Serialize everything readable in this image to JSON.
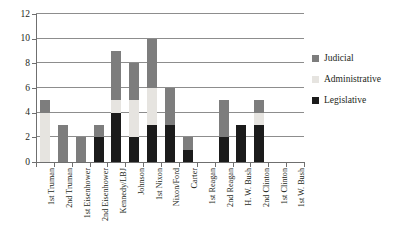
{
  "chart_data": {
    "type": "bar",
    "stacked": true,
    "title": "",
    "xlabel": "",
    "ylabel": "",
    "ylim": [
      0,
      12
    ],
    "ytick_values": [
      0,
      2,
      4,
      6,
      8,
      10,
      12
    ],
    "ytick_labels": [
      "0",
      "2",
      "4",
      "6",
      "8",
      "10",
      "12"
    ],
    "grid": true,
    "grid_axis": "y",
    "legend_position": "right",
    "categories": [
      "1st Truman",
      "2nd Truman",
      "1st Eisenhower",
      "2nd Eisenhower",
      "Kennedy/LBJ",
      "Johnson",
      "1st Nixon",
      "Nixon/Ford",
      "Carter",
      "1st Reagan",
      "2nd Reagan",
      "H. W. Bush",
      "2nd Clinton",
      "1st Clinton",
      "1st W. Bush"
    ],
    "series": [
      {
        "name": "Legislative",
        "color": "#1b1b1b",
        "values": [
          0,
          0,
          0,
          2,
          4,
          2,
          3,
          3,
          1,
          0,
          2,
          3,
          3,
          0,
          0
        ]
      },
      {
        "name": "Administrative",
        "color": "#e6e4e0",
        "values": [
          4,
          0,
          0,
          0,
          1,
          3,
          3,
          0,
          0,
          0,
          0,
          0,
          1,
          0,
          0
        ]
      },
      {
        "name": "Judicial",
        "color": "#7d7d7d",
        "values": [
          1,
          3,
          2,
          1,
          4,
          3,
          4,
          3,
          1,
          0,
          3,
          0,
          1,
          0,
          0
        ]
      }
    ],
    "totals": [
      5,
      3,
      2,
      3,
      9,
      8,
      10,
      6,
      2,
      0,
      5,
      3,
      5,
      0,
      0
    ]
  },
  "legend": {
    "entries": [
      {
        "label": "Judicial",
        "color": "#7d7d7d"
      },
      {
        "label": "Administrative",
        "color": "#e6e4e0"
      },
      {
        "label": "Legislative",
        "color": "#1b1b1b"
      }
    ]
  },
  "axis_colors": {
    "axis_line": "#6f6f6f",
    "gridline": "#8d8d8d",
    "text": "#231f20"
  }
}
